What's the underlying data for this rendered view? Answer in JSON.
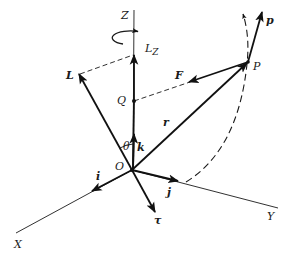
{
  "figure": {
    "colors": {
      "ink": "#111111",
      "background": "#ffffff"
    },
    "axes": {
      "z": {
        "label": "Z"
      },
      "x": {
        "label": "X"
      },
      "y": {
        "label": "Y"
      }
    },
    "unit_vectors": {
      "i": {
        "label": "i"
      },
      "j": {
        "label": "j"
      },
      "k": {
        "label": "k"
      }
    },
    "points": {
      "origin": {
        "label": "O"
      },
      "q": {
        "label": "Q"
      },
      "p_point": {
        "label": "P"
      }
    },
    "vectors": {
      "angular_momentum": {
        "label": "L"
      },
      "lz_component": {
        "label": "L",
        "subscript": "Z"
      },
      "position": {
        "label": "r"
      },
      "force": {
        "label": "F"
      },
      "momentum": {
        "label": "p"
      },
      "torque": {
        "label": "τ"
      }
    },
    "angle": {
      "label": "θ"
    }
  }
}
